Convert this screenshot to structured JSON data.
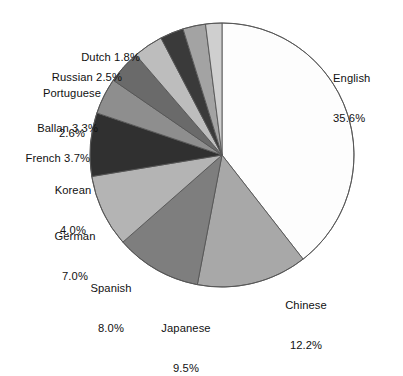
{
  "chart_data": {
    "type": "pie",
    "title": "",
    "subtitle": "",
    "xlabel": "",
    "ylabel": "",
    "legend_position": "none",
    "grid": false,
    "units": "percent",
    "start_angle_deg": 0,
    "direction": "clockwise",
    "categories": [
      "English",
      "Chinese",
      "Japanese",
      "Spanish",
      "German",
      "Korean",
      "French",
      "Ballan",
      "Portuguese",
      "Russian",
      "Dutch"
    ],
    "values": [
      35.6,
      12.2,
      9.5,
      8.0,
      7.0,
      4.0,
      3.7,
      3.3,
      2.6,
      2.5,
      1.8
    ],
    "slices": [
      {
        "name": "English",
        "value": 35.6,
        "value_text": "35.6%",
        "label_line1": "English",
        "label_line2": "35.6%",
        "color": "#fdfdfd"
      },
      {
        "name": "Chinese",
        "value": 12.2,
        "value_text": "12.2%",
        "label_line1": "Chinese",
        "label_line2": "12.2%",
        "color": "#a8a8a8"
      },
      {
        "name": "Japanese",
        "value": 9.5,
        "value_text": "9.5%",
        "label_line1": "Japanese",
        "label_line2": "9.5%",
        "color": "#7e7e7e"
      },
      {
        "name": "Spanish",
        "value": 8.0,
        "value_text": "8.0%",
        "label_line1": "Spanish",
        "label_line2": "8.0%",
        "color": "#b4b4b4"
      },
      {
        "name": "German",
        "value": 7.0,
        "value_text": "7.0%",
        "label_line1": "German",
        "label_line2": "7.0%",
        "color": "#303030"
      },
      {
        "name": "Korean",
        "value": 4.0,
        "value_text": "4.0%",
        "label_line1": "Korean",
        "label_line2": "4.0%",
        "color": "#8e8e8e"
      },
      {
        "name": "French",
        "value": 3.7,
        "value_text": "3.7%",
        "label_line1": "French 3.7%",
        "label_line2": "",
        "color": "#6a6a6a"
      },
      {
        "name": "Ballan",
        "value": 3.3,
        "value_text": "3.3%",
        "label_line1": "Ballan 3.3%",
        "label_line2": "",
        "color": "#bdbdbd"
      },
      {
        "name": "Portuguese",
        "value": 2.6,
        "value_text": "2.6%",
        "label_line1": "Portuguese",
        "label_line2": "2.6%",
        "color": "#3a3a3a"
      },
      {
        "name": "Russian",
        "value": 2.5,
        "value_text": "2.5%",
        "label_line1": "Russian 2.5%",
        "label_line2": "",
        "color": "#a3a3a3"
      },
      {
        "name": "Dutch",
        "value": 1.8,
        "value_text": "1.8%",
        "label_line1": "Dutch 1.8%",
        "label_line2": "",
        "color": "#cfcfcf"
      }
    ],
    "extra_wedges": [
      {
        "name": "wedge-light-1",
        "color": "#dcdcdc"
      },
      {
        "name": "wedge-mid-1",
        "color": "#9a9a9a"
      },
      {
        "name": "wedge-light-2",
        "color": "#e6e6e6"
      }
    ],
    "geometry": {
      "center_x": 222,
      "center_y": 155,
      "radius": 132
    },
    "stroke_color": "#555555",
    "background": "#ffffff"
  },
  "labels": {
    "english": {
      "line1": "English",
      "line2": "35.6%"
    },
    "chinese": {
      "line1": "Chinese",
      "line2": "12.2%"
    },
    "japanese": {
      "line1": "Japanese",
      "line2": "9.5%"
    },
    "spanish": {
      "line1": "Spanish",
      "line2": "8.0%"
    },
    "german": {
      "line1": "German",
      "line2": "7.0%"
    },
    "korean": {
      "line1": "Korean",
      "line2": "4.0%"
    },
    "french": {
      "line1": "French 3.7%",
      "line2": ""
    },
    "ballan": {
      "line1": "Ballan 3.3%",
      "line2": ""
    },
    "portuguese": {
      "line1": "Portuguese",
      "line2": "2.6%"
    },
    "russian": {
      "line1": "Russian 2.5%",
      "line2": ""
    },
    "dutch": {
      "line1": "Dutch 1.8%",
      "line2": ""
    }
  }
}
